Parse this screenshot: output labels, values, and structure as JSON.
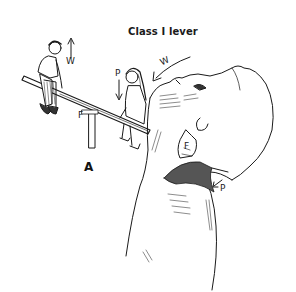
{
  "figure": {
    "title": "Class I lever",
    "panel_label": "A",
    "seesaw": {
      "labels": {
        "weight": "W",
        "power": "P",
        "fulcrum": "F"
      }
    },
    "head": {
      "labels": {
        "weight": "W",
        "fulcrum": "F",
        "power": "P"
      }
    },
    "colors": {
      "ink": "#1a1a1a",
      "background": "#ffffff",
      "shade": "#555555"
    }
  }
}
